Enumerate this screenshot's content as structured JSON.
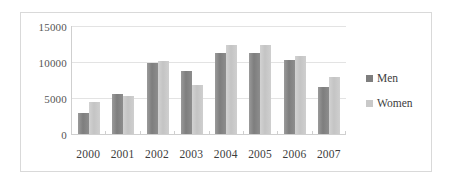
{
  "chart_data": {
    "type": "bar",
    "title": "",
    "subtitle": "",
    "xlabel": "",
    "ylabel": "",
    "categories": [
      "2000",
      "2001",
      "2002",
      "2003",
      "2004",
      "2005",
      "2006",
      "2007"
    ],
    "series": [
      {
        "name": "Men",
        "color": "#7e7e7e",
        "values": [
          2900,
          5500,
          9800,
          8700,
          11200,
          11100,
          10200,
          6500
        ]
      },
      {
        "name": "Women",
        "color": "#c9c9c9",
        "values": [
          4400,
          5300,
          10100,
          6800,
          12300,
          12300,
          10800,
          7800
        ]
      }
    ],
    "ylim": [
      0,
      15000
    ],
    "yticks": [
      0,
      5000,
      10000,
      15000
    ],
    "ytick_labels": [
      "0",
      "5000",
      "10000",
      "15000"
    ],
    "grid": true,
    "legend_position": "right"
  },
  "legend": {
    "entries": [
      {
        "label": "Men"
      },
      {
        "label": "Women"
      }
    ]
  }
}
